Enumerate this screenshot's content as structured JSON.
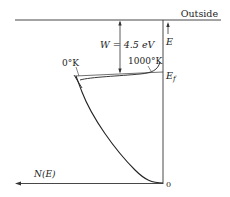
{
  "diagram": {
    "type": "energy-band / density of states",
    "labels": {
      "outside": "Outside",
      "energy_axis": "E",
      "fermi_level": "E",
      "fermi_sub": "f",
      "work_function": "W = 4.5 eV",
      "temp_low": "0°K",
      "temp_high": "1000°K",
      "dos_axis": "N(E)",
      "origin": "0"
    },
    "colors": {
      "ink": "#222222",
      "background": "#ffffff"
    }
  }
}
